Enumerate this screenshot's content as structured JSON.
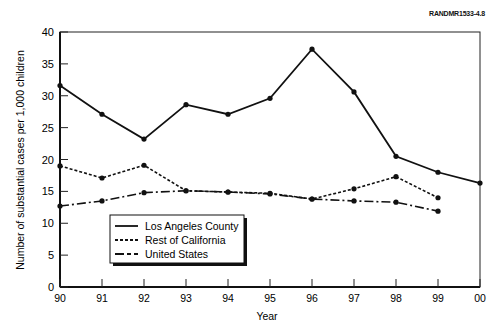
{
  "figure_ref": "RANDMR1533-4.8",
  "chart_data": {
    "type": "line",
    "title": "",
    "xlabel": "Year",
    "ylabel": "Number of substantial cases per 1,000 children",
    "x": [
      "90",
      "91",
      "92",
      "93",
      "94",
      "95",
      "96",
      "97",
      "98",
      "99",
      "00"
    ],
    "ylim": [
      0,
      40
    ],
    "yticks": [
      0,
      5,
      10,
      15,
      20,
      25,
      30,
      35,
      40
    ],
    "grid": false,
    "legend_position": "lower-left-inside",
    "series": [
      {
        "name": "Los Angeles County",
        "style": "solid",
        "values": [
          31.6,
          27.1,
          23.2,
          28.6,
          27.1,
          29.6,
          37.3,
          30.6,
          20.5,
          18.0,
          16.3
        ]
      },
      {
        "name": "Rest of California",
        "style": "dotted",
        "values": [
          19.0,
          17.1,
          19.1,
          15.1,
          14.9,
          14.7,
          13.8,
          15.4,
          17.3,
          14.0,
          null
        ]
      },
      {
        "name": "United States",
        "style": "dash-dot",
        "values": [
          12.7,
          13.5,
          14.8,
          15.1,
          14.9,
          14.6,
          13.8,
          13.5,
          13.3,
          11.9,
          null
        ]
      }
    ]
  }
}
